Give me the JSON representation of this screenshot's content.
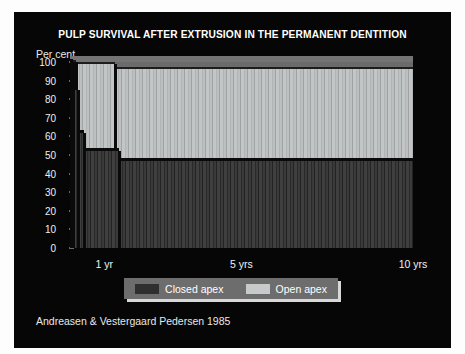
{
  "slide": {
    "title": "PULP SURVIVAL AFTER EXTRUSION IN THE PERMANENT DENTITION",
    "caption": "Andreasen & Vestergaard Pedersen 1985",
    "background_color": "#060606",
    "title_color": "#ffffff"
  },
  "legend": {
    "items": [
      {
        "label": "Closed apex",
        "color": "#2f2f2f"
      },
      {
        "label": "Open apex",
        "color": "#c6caca"
      }
    ]
  },
  "chart_data": {
    "type": "area",
    "title": "PULP SURVIVAL AFTER EXTRUSION IN THE PERMANENT DENTITION",
    "subtitle": "",
    "xlabel": "",
    "ylabel": "Per cent",
    "xlim": [
      0,
      10
    ],
    "ylim": [
      0,
      100
    ],
    "grid": false,
    "legend_position": "bottom-center",
    "step_interpolation": "post",
    "y_ticks": [
      0,
      10,
      20,
      30,
      40,
      50,
      60,
      70,
      80,
      90,
      100
    ],
    "y_tick_labels": [
      "0",
      "10",
      "20",
      "30",
      "40",
      "50",
      "60",
      "70",
      "80",
      "90",
      "100"
    ],
    "x_ticks": [
      1,
      5,
      10
    ],
    "x_tick_labels": [
      "1 yr",
      "5 yrs",
      "10 yrs"
    ],
    "series": [
      {
        "name": "Open apex",
        "color": "#b8bcbc",
        "steps": [
          {
            "x_start": 0.0,
            "x_end": 0.18,
            "value": 100
          },
          {
            "x_start": 0.18,
            "x_end": 1.3,
            "value": 99
          },
          {
            "x_start": 1.3,
            "x_end": 10.0,
            "value": 96
          }
        ]
      },
      {
        "name": "Closed apex",
        "color": "#3a3a3a",
        "steps": [
          {
            "x_start": 0.0,
            "x_end": 0.1,
            "value": 100
          },
          {
            "x_start": 0.1,
            "x_end": 0.22,
            "value": 85
          },
          {
            "x_start": 0.22,
            "x_end": 0.42,
            "value": 62
          },
          {
            "x_start": 0.42,
            "x_end": 1.42,
            "value": 52
          },
          {
            "x_start": 1.42,
            "x_end": 10.0,
            "value": 47
          }
        ]
      }
    ],
    "annotations": []
  }
}
